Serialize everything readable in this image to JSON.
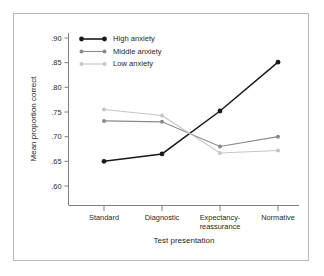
{
  "chart_data": {
    "type": "line",
    "title": "",
    "xlabel": "Test presentation",
    "ylabel": "Mean proportion correct",
    "categories": [
      "Standard",
      "Diagnostic",
      "Expectancy-\nreassurance",
      "Normative"
    ],
    "category_labels": [
      {
        "line1": "Standard",
        "line2": ""
      },
      {
        "line1": "Diagnostic",
        "line2": ""
      },
      {
        "line1": "Expectancy-",
        "line2": "reassurance"
      },
      {
        "line1": "Normative",
        "line2": ""
      }
    ],
    "ylim": [
      0.585,
      0.9
    ],
    "yticks": [
      0.9,
      0.85,
      0.8,
      0.75,
      0.7,
      0.65,
      0.6
    ],
    "ytick_labels": [
      ".90",
      ".85",
      ".80",
      ".75",
      ".70",
      ".65",
      ".60"
    ],
    "grid": false,
    "legend_position": "top-left-inside",
    "series": [
      {
        "name": "High anxiety",
        "color": "#1a1a1a",
        "marker": "filled-circle",
        "values": [
          0.65,
          0.665,
          0.752,
          0.851
        ]
      },
      {
        "name": "Middle anxiety",
        "color": "#8a8a8a",
        "marker": "filled-circle",
        "values": [
          0.732,
          0.73,
          0.68,
          0.7
        ]
      },
      {
        "name": "Low anxiety",
        "color": "#c5c5c5",
        "marker": "filled-circle",
        "values": [
          0.755,
          0.743,
          0.667,
          0.672
        ]
      }
    ]
  },
  "axis": {
    "y_title": "Mean proportion correct",
    "x_title": "Test presentation"
  },
  "legend": {
    "items": [
      {
        "label": "High anxiety",
        "color": "#1a1a1a"
      },
      {
        "label": "Middle anxiety",
        "color": "#8a8a8a"
      },
      {
        "label": "Low anxiety",
        "color": "#c5c5c5"
      }
    ]
  }
}
